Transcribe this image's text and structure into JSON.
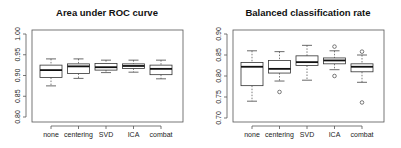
{
  "chart_data": [
    {
      "type": "box",
      "title": "Area under ROC curve",
      "xlabel": "",
      "ylabel": "",
      "categories": [
        "none",
        "centering",
        "SVD",
        "ICA",
        "combat"
      ],
      "ylim": [
        0.8,
        1.0
      ],
      "yticks": [
        0.8,
        0.85,
        0.9,
        0.95,
        1.0
      ],
      "ytick_labels": [
        "0.80",
        "0.85",
        "0.90",
        "0.95",
        "1.00"
      ],
      "grid": false,
      "boxes": [
        {
          "whisker_low": 0.875,
          "q1": 0.895,
          "median": 0.913,
          "q3": 0.925,
          "whisker_high": 0.94,
          "outliers": []
        },
        {
          "whisker_low": 0.893,
          "q1": 0.905,
          "median": 0.922,
          "q3": 0.928,
          "whisker_high": 0.94,
          "outliers": []
        },
        {
          "whisker_low": 0.907,
          "q1": 0.913,
          "median": 0.92,
          "q3": 0.929,
          "whisker_high": 0.937,
          "outliers": []
        },
        {
          "whisker_low": 0.908,
          "q1": 0.917,
          "median": 0.923,
          "q3": 0.928,
          "whisker_high": 0.937,
          "outliers": []
        },
        {
          "whisker_low": 0.892,
          "q1": 0.902,
          "median": 0.916,
          "q3": 0.925,
          "whisker_high": 0.937,
          "outliers": []
        }
      ]
    },
    {
      "type": "box",
      "title": "Balanced classification rate",
      "xlabel": "",
      "ylabel": "",
      "categories": [
        "none",
        "centering",
        "SVD",
        "ICA",
        "combat"
      ],
      "ylim": [
        0.7,
        0.9
      ],
      "yticks": [
        0.7,
        0.75,
        0.8,
        0.85,
        0.9
      ],
      "ytick_labels": [
        "0.70",
        "0.75",
        "0.80",
        "0.85",
        "0.90"
      ],
      "grid": false,
      "boxes": [
        {
          "whisker_low": 0.74,
          "q1": 0.777,
          "median": 0.822,
          "q3": 0.832,
          "whisker_high": 0.86,
          "outliers": []
        },
        {
          "whisker_low": 0.788,
          "q1": 0.807,
          "median": 0.817,
          "q3": 0.837,
          "whisker_high": 0.858,
          "outliers": [
            0.762
          ]
        },
        {
          "whisker_low": 0.79,
          "q1": 0.825,
          "median": 0.833,
          "q3": 0.848,
          "whisker_high": 0.873,
          "outliers": []
        },
        {
          "whisker_low": 0.815,
          "q1": 0.829,
          "median": 0.837,
          "q3": 0.843,
          "whisker_high": 0.86,
          "outliers": [
            0.87,
            0.8
          ]
        },
        {
          "whisker_low": 0.785,
          "q1": 0.81,
          "median": 0.822,
          "q3": 0.829,
          "whisker_high": 0.85,
          "outliers": [
            0.858,
            0.737
          ]
        }
      ]
    }
  ]
}
